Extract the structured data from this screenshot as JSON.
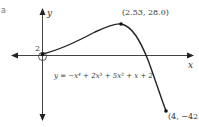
{
  "figure": {
    "edge_fragment": "a",
    "axes": {
      "x_label": "x",
      "y_label": "y"
    },
    "y_intercept_label": "2",
    "equation": "y = −x⁴ + 2x³ + 5x² + x + 2",
    "points": [
      {
        "name": "maximum",
        "label": "(2.53, 28.0)",
        "x": 2.53,
        "y": 28.0
      },
      {
        "name": "endpoint",
        "label": "(4, −42)",
        "x": 4,
        "y": -42
      },
      {
        "name": "y-intercept",
        "label": "2",
        "x": 0,
        "y": 2,
        "marker": "open-circle"
      }
    ],
    "colors": {
      "curve": "#222222",
      "axes": "#444444",
      "text": "#333333"
    }
  }
}
